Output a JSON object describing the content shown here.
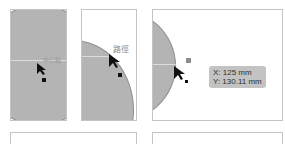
{
  "panels": [
    {
      "id": "center-point",
      "hint_label": "中心點"
    },
    {
      "id": "path",
      "hint_label": "路徑"
    },
    {
      "id": "coordinates",
      "hint_label": ""
    }
  ],
  "tooltip": {
    "x": "X: 125 mm",
    "y": "Y: 130.11 mm"
  },
  "colors": {
    "shape_fill": "#b4b4b4",
    "shape_stroke": "#8f8f8f",
    "panel_border": "#c4c4c4",
    "tooltip_bg": "#c3c3c3"
  }
}
